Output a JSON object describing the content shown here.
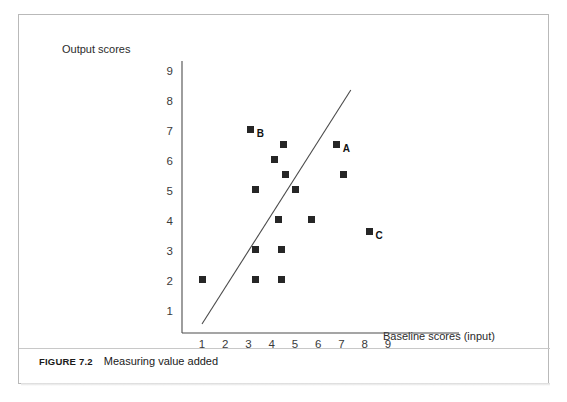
{
  "figure": {
    "number": "FIGURE 7.2",
    "caption": "Measuring value added"
  },
  "chart_data": {
    "type": "scatter",
    "title": "Measuring value added",
    "xlabel": "Baseline scores (input)",
    "ylabel": "Output scores",
    "xlim": [
      0,
      9.8
    ],
    "ylim": [
      0,
      9.6
    ],
    "xticks": [
      "1",
      "2",
      "3",
      "4",
      "5",
      "6",
      "7",
      "8",
      "9"
    ],
    "yticks": [
      "1",
      "2",
      "3",
      "4",
      "5",
      "6",
      "7",
      "8",
      "9"
    ],
    "grid": false,
    "legend": "none",
    "points": [
      {
        "x": 1.0,
        "y": 2.1,
        "label": ""
      },
      {
        "x": 3.1,
        "y": 7.1,
        "label": "B"
      },
      {
        "x": 4.5,
        "y": 6.6,
        "label": ""
      },
      {
        "x": 4.1,
        "y": 6.1,
        "label": ""
      },
      {
        "x": 3.3,
        "y": 5.1,
        "label": ""
      },
      {
        "x": 4.6,
        "y": 5.6,
        "label": ""
      },
      {
        "x": 5.0,
        "y": 5.1,
        "label": ""
      },
      {
        "x": 6.8,
        "y": 6.6,
        "label": "A"
      },
      {
        "x": 7.1,
        "y": 5.6,
        "label": ""
      },
      {
        "x": 4.3,
        "y": 4.1,
        "label": ""
      },
      {
        "x": 5.7,
        "y": 4.1,
        "label": ""
      },
      {
        "x": 8.2,
        "y": 3.7,
        "label": "C"
      },
      {
        "x": 3.3,
        "y": 3.1,
        "label": ""
      },
      {
        "x": 4.4,
        "y": 3.1,
        "label": ""
      },
      {
        "x": 3.3,
        "y": 2.1,
        "label": ""
      },
      {
        "x": 4.4,
        "y": 2.1,
        "label": ""
      }
    ],
    "trendline": {
      "x1": 1.0,
      "y1": 0.6,
      "x2": 7.4,
      "y2": 8.4
    }
  }
}
